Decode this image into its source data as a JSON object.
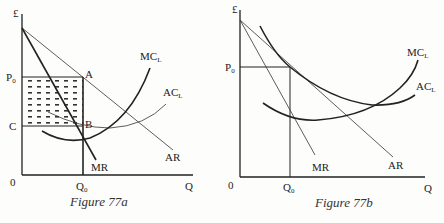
{
  "figures": [
    {
      "id": "77a",
      "caption": "Figure 77a",
      "y_axis_label": "£",
      "x_axis_label": "Q",
      "origin_label": "0",
      "price_label": "P",
      "price_sub": "0",
      "cost_label": "C",
      "quantity_label": "Q",
      "quantity_sub": "0",
      "point_a": "A",
      "point_b": "B",
      "curves": {
        "mc": "MC",
        "mc_sub": "L",
        "ac": "AC",
        "ac_sub": "L",
        "ar": "AR",
        "mr": "MR"
      },
      "shaded_region": "supernormal profit (P0–C × 0–Q0)"
    },
    {
      "id": "77b",
      "caption": "Figure 77b",
      "y_axis_label": "£",
      "x_axis_label": "Q",
      "origin_label": "0",
      "price_label": "P",
      "price_sub": "0",
      "quantity_label": "Q",
      "quantity_sub": "0",
      "curves": {
        "mc": "MC",
        "mc_sub": "L",
        "ac": "AC",
        "ac_sub": "L",
        "ar": "AR",
        "mr": "MR"
      }
    }
  ]
}
